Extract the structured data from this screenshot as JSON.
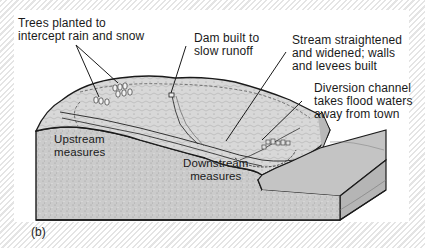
{
  "figure": {
    "panel_label": "(b)",
    "colors": {
      "background_hatch": "#e4e4e4",
      "panel": "#ffffff",
      "ground": "#c9c9c9",
      "outline": "#1a1a1a",
      "text": "#1a1a1a"
    }
  },
  "callouts": [
    {
      "id": "trees",
      "text": "Trees planted to\nintercept rain and snow"
    },
    {
      "id": "dam",
      "text": "Dam built to\nslow runoff"
    },
    {
      "id": "stream",
      "text": "Stream straightened\nand widened; walls\nand levees built"
    },
    {
      "id": "diversion",
      "text": "Diversion channel\ntakes flood waters\naway from town"
    }
  ],
  "region_labels": [
    {
      "id": "upstream",
      "text": "Upstream\nmeasures"
    },
    {
      "id": "downstream",
      "text": "Downstream\nmeasures"
    }
  ]
}
